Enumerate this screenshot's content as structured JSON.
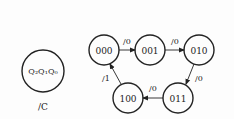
{
  "legend": {
    "state_label": "Q₂Q₁Q₀",
    "output_label": "/C"
  },
  "states": [
    {
      "id": "s000",
      "label": "000",
      "cx": 104,
      "cy": 50
    },
    {
      "id": "s001",
      "label": "001",
      "cx": 150,
      "cy": 50
    },
    {
      "id": "s010",
      "label": "010",
      "cx": 199,
      "cy": 50
    },
    {
      "id": "s011",
      "label": "011",
      "cx": 178,
      "cy": 98
    },
    {
      "id": "s100",
      "label": "100",
      "cx": 128,
      "cy": 98
    }
  ],
  "transitions": [
    {
      "from": "000",
      "to": "001",
      "label": "/0"
    },
    {
      "from": "001",
      "to": "010",
      "label": "/0"
    },
    {
      "from": "010",
      "to": "011",
      "label": "/0"
    },
    {
      "from": "011",
      "to": "100",
      "label": "/0"
    },
    {
      "from": "100",
      "to": "000",
      "label": "/1"
    }
  ]
}
